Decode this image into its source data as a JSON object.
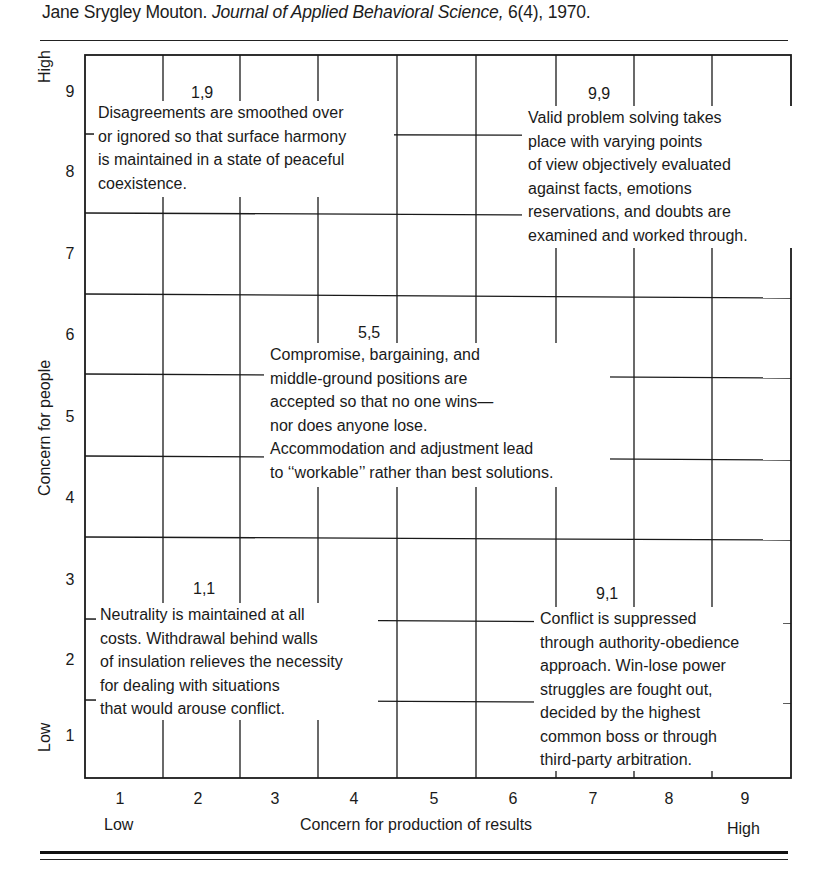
{
  "citation": {
    "authors": "Jane Srygley Mouton.",
    "journal": "Journal of Applied Behavioral Science,",
    "issue_year": "6(4), 1970."
  },
  "grid": {
    "title": "Conflict grid",
    "x_axis": {
      "label": "Concern for production of results",
      "low": "Low",
      "high": "High",
      "ticks": [
        "1",
        "2",
        "3",
        "4",
        "5",
        "6",
        "7",
        "8",
        "9"
      ]
    },
    "y_axis": {
      "label": "Concern for people",
      "low": "Low",
      "high": "High",
      "ticks": [
        "9",
        "8",
        "7",
        "6",
        "5",
        "4",
        "3",
        "2",
        "1"
      ]
    },
    "styles": [
      {
        "coord": "1,9",
        "text": "Disagreements are smoothed over\nor ignored so that surface harmony\nis maintained in a state of peaceful\ncoexistence."
      },
      {
        "coord": "9,9",
        "text": "Valid problem solving takes\nplace with varying points\nof view objectively evaluated\nagainst facts, emotions\nreservations, and doubts are\nexamined and worked through."
      },
      {
        "coord": "5,5",
        "text": "Compromise, bargaining, and\nmiddle-ground positions are\naccepted so that no one wins—\nnor does anyone lose.\nAccommodation and adjustment lead\nto ‘‘workable’’ rather than best solutions."
      },
      {
        "coord": "1,1",
        "text": "Neutrality is maintained at all\ncosts. Withdrawal behind walls\nof insulation relieves the necessity\nfor dealing with situations\nthat would arouse conflict."
      },
      {
        "coord": "9,1",
        "text": "Conflict is suppressed\nthrough authority-obedience\napproach. Win-lose power\nstruggles are fought out,\ndecided by the highest\ncommon boss or through\nthird-party arbitration."
      }
    ]
  }
}
